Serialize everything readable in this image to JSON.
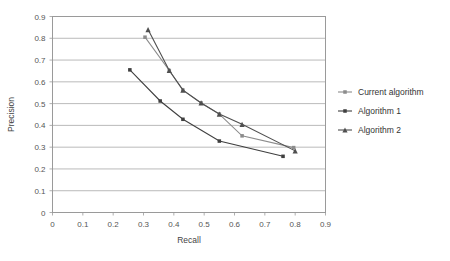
{
  "chart_data": {
    "type": "line",
    "title": "",
    "xlabel": "Recall",
    "ylabel": "Precision",
    "xlim": [
      0,
      0.9
    ],
    "ylim": [
      0,
      0.9
    ],
    "xticks": [
      "0",
      "0.1",
      "0.2",
      "0.3",
      "0.4",
      "0.5",
      "0.6",
      "0.7",
      "0.8",
      "0.9"
    ],
    "yticks": [
      "0",
      "0.1",
      "0.2",
      "0.3",
      "0.4",
      "0.5",
      "0.6",
      "0.7",
      "0.8",
      "0.9"
    ],
    "xtick_values": [
      0,
      0.1,
      0.2,
      0.3,
      0.4,
      0.5,
      0.6,
      0.7,
      0.8,
      0.9
    ],
    "ytick_values": [
      0,
      0.1,
      0.2,
      0.3,
      0.4,
      0.5,
      0.6,
      0.7,
      0.8,
      0.9
    ],
    "grid": "horizontal",
    "legend_position": "right",
    "series": [
      {
        "name": "Current algorithm",
        "color": "#8c8c8c",
        "marker": "square",
        "x": [
          0.305,
          0.385,
          0.43,
          0.49,
          0.55,
          0.625,
          0.795
        ],
        "y": [
          0.805,
          0.652,
          0.562,
          0.503,
          0.452,
          0.352,
          0.298
        ]
      },
      {
        "name": "Algorithm 1",
        "color": "#3f3f3f",
        "marker": "square",
        "x": [
          0.255,
          0.355,
          0.43,
          0.55,
          0.76
        ],
        "y": [
          0.655,
          0.512,
          0.428,
          0.328,
          0.258
        ]
      },
      {
        "name": "Algorithm 2",
        "color": "#4f4f4f",
        "marker": "triangle",
        "x": [
          0.315,
          0.385,
          0.43,
          0.49,
          0.55,
          0.625,
          0.8
        ],
        "y": [
          0.84,
          0.652,
          0.562,
          0.503,
          0.452,
          0.405,
          0.283
        ]
      }
    ]
  },
  "legend": {
    "items": [
      {
        "label": "Current algorithm"
      },
      {
        "label": "Algorithm 1"
      },
      {
        "label": "Algorithm 2"
      }
    ]
  },
  "colors": {
    "frame": "#9a9a9a",
    "grid": "#a8a8a8",
    "background": "#ffffff"
  }
}
